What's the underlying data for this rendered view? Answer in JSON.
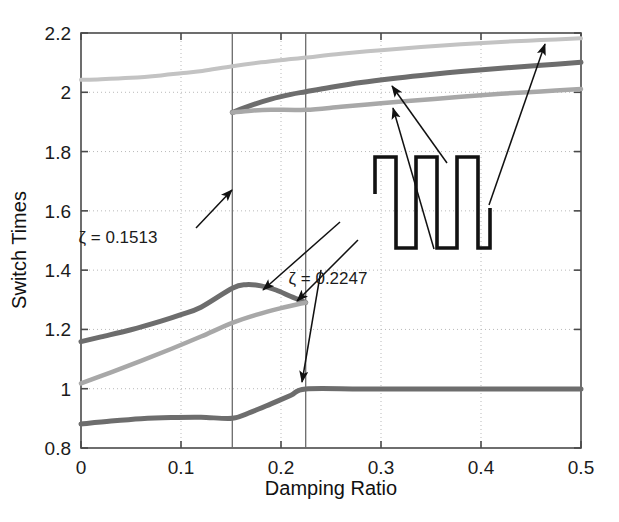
{
  "figure": {
    "background_color": "#ffffff",
    "plot_area": {
      "left": 81,
      "top": 33,
      "right": 581,
      "bottom": 448
    }
  },
  "chart_data": {
    "type": "line",
    "title": "",
    "xlabel": "Damping Ratio",
    "ylabel": "Switch Times",
    "xlim": [
      0,
      0.5
    ],
    "ylim": [
      0.8,
      2.2
    ],
    "xticks": [
      0,
      0.1,
      0.2,
      0.3,
      0.4,
      0.5
    ],
    "xtick_labels": [
      "0",
      "0.1",
      "0.2",
      "0.3",
      "0.4",
      "0.5"
    ],
    "yticks": [
      0.8,
      1.0,
      1.2,
      1.4,
      1.6,
      1.8,
      2.0,
      2.2
    ],
    "ytick_labels": [
      "0.8",
      "1",
      "1.2",
      "1.4",
      "1.6",
      "1.8",
      "2",
      "2.2"
    ],
    "grid": true,
    "grid_style": "dotted",
    "grid_color": "#b9b9b9",
    "legend": "none",
    "series": [
      {
        "name": "switch-time-upper-light",
        "color": "#c3c3c3",
        "width": 4.0,
        "x": [
          0,
          0.02,
          0.05,
          0.08,
          0.1,
          0.1213,
          0.1513,
          0.18,
          0.21,
          0.2247,
          0.26,
          0.3,
          0.34,
          0.38,
          0.42,
          0.46,
          0.5
        ],
        "y": [
          2.042,
          2.044,
          2.049,
          2.057,
          2.064,
          2.072,
          2.088,
          2.101,
          2.112,
          2.117,
          2.13,
          2.142,
          2.153,
          2.162,
          2.17,
          2.176,
          2.182
        ]
      },
      {
        "name": "switch-time-upper-dark",
        "color": "#6d6d6d",
        "width": 5.0,
        "x": [
          0.1513,
          0.17,
          0.19,
          0.21,
          0.2247,
          0.25,
          0.28,
          0.31,
          0.34,
          0.38,
          0.42,
          0.46,
          0.5
        ],
        "y": [
          1.932,
          1.956,
          1.977,
          1.993,
          2.002,
          2.017,
          2.033,
          2.046,
          2.057,
          2.07,
          2.081,
          2.091,
          2.101
        ]
      },
      {
        "name": "switch-time-upper-medium",
        "color": "#a8a8a8",
        "width": 4.5,
        "x": [
          0.1513,
          0.17,
          0.19,
          0.2247,
          0.26,
          0.3,
          0.34,
          0.38,
          0.42,
          0.46,
          0.5
        ],
        "y": [
          1.932,
          1.938,
          1.941,
          1.941,
          1.951,
          1.963,
          1.974,
          1.985,
          1.995,
          2.003,
          2.011
        ]
      },
      {
        "name": "switch-time-mid-dark",
        "color": "#6d6d6d",
        "width": 5.0,
        "x": [
          0,
          0.02,
          0.05,
          0.08,
          0.1,
          0.12,
          0.1513,
          0.165,
          0.18,
          0.195,
          0.21,
          0.2247
        ],
        "y": [
          1.159,
          1.175,
          1.199,
          1.228,
          1.25,
          1.275,
          1.339,
          1.351,
          1.347,
          1.333,
          1.311,
          1.291
        ]
      },
      {
        "name": "switch-time-mid-medium",
        "color": "#a8a8a8",
        "width": 4.5,
        "x": [
          0,
          0.03,
          0.06,
          0.09,
          0.12,
          0.1513,
          0.175,
          0.2,
          0.2247
        ],
        "y": [
          1.018,
          1.055,
          1.094,
          1.134,
          1.176,
          1.222,
          1.249,
          1.272,
          1.291
        ]
      },
      {
        "name": "switch-time-lower-dark",
        "color": "#6d6d6d",
        "width": 5.0,
        "x": [
          0,
          0.03,
          0.06,
          0.09,
          0.12,
          0.1513,
          0.17,
          0.19,
          0.21,
          0.2247,
          0.28,
          0.34,
          0.4,
          0.46,
          0.5
        ],
        "y": [
          0.881,
          0.891,
          0.899,
          0.903,
          0.904,
          0.9,
          0.921,
          0.949,
          0.978,
          0.999,
          0.999,
          0.999,
          0.999,
          0.999,
          0.999
        ]
      }
    ],
    "vertical_markers": [
      {
        "name": "zeta-marker-1",
        "x": 0.1513,
        "label": "ζ = 0.1513",
        "color": "#6a6a6a"
      },
      {
        "name": "zeta-marker-2",
        "x": 0.2247,
        "label": "ζ = 0.2247",
        "color": "#6a6a6a"
      }
    ],
    "annotations": [
      {
        "name": "zeta-1-annotation",
        "text": "ζ = 0.1513",
        "text_x": 118,
        "text_y": 243,
        "arrow_from": [
          196,
          228
        ],
        "arrow_to": [
          232,
          190
        ]
      },
      {
        "name": "zeta-2-annotation",
        "text": "ζ = 0.2247",
        "text_x": 328,
        "text_y": 284,
        "arrow_from": [
          321,
          270
        ],
        "arrow_to": [
          302,
          382
        ]
      }
    ],
    "inset": {
      "name": "bang-bang-control-profile",
      "description": "square wave command profile",
      "color": "#121212",
      "line_width": 3.6,
      "points": [
        [
          375,
          194
        ],
        [
          375,
          157
        ],
        [
          396,
          157
        ],
        [
          396,
          248
        ],
        [
          416,
          248
        ],
        [
          416,
          157
        ],
        [
          437,
          157
        ],
        [
          437,
          248
        ],
        [
          457,
          248
        ],
        [
          457,
          157
        ],
        [
          478,
          157
        ],
        [
          478,
          248
        ],
        [
          490,
          248
        ],
        [
          490,
          208
        ]
      ]
    },
    "pointer_arrows": [
      {
        "name": "arrow-to-upper-dark",
        "from": [
          447,
          163
        ],
        "to": [
          392,
          86
        ]
      },
      {
        "name": "arrow-to-upper-medium",
        "from": [
          434,
          249
        ],
        "to": [
          393,
          108
        ]
      },
      {
        "name": "arrow-to-upper-light",
        "from": [
          489,
          205
        ],
        "to": [
          545,
          44
        ]
      },
      {
        "name": "arrow-to-mid-dark",
        "from": [
          340,
          222
        ],
        "to": [
          263,
          290
        ]
      },
      {
        "name": "arrow-to-mid-merge",
        "from": [
          358,
          240
        ],
        "to": [
          297,
          301
        ]
      }
    ]
  }
}
